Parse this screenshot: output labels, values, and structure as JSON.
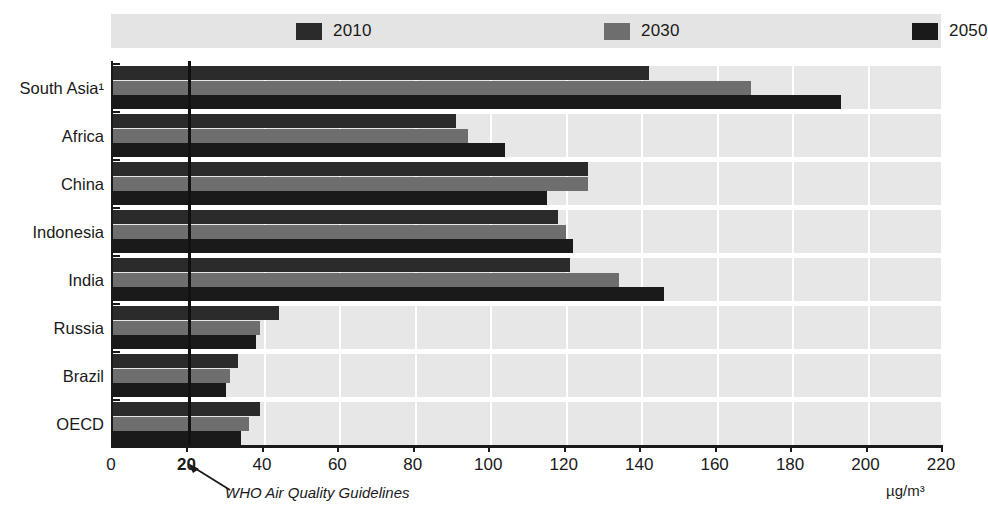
{
  "chart_data": {
    "type": "bar",
    "orientation": "horizontal",
    "title": "",
    "xlabel": "µg/m³",
    "ylabel": "",
    "xlim": [
      0,
      220
    ],
    "xticks": [
      0,
      20,
      40,
      60,
      80,
      100,
      120,
      140,
      160,
      180,
      200,
      220
    ],
    "emphasized_tick": "20",
    "grid": true,
    "legend_position": "top",
    "categories": [
      "South Asia¹",
      "Africa",
      "China",
      "Indonesia",
      "India",
      "Russia",
      "Brazil",
      "OECD"
    ],
    "series": [
      {
        "name": "2010",
        "color": "#2b2b2b",
        "values": [
          142,
          91,
          126,
          118,
          121,
          44,
          33,
          39
        ]
      },
      {
        "name": "2030",
        "color": "#6e6e6e",
        "values": [
          169,
          94,
          126,
          120,
          134,
          39,
          31,
          36
        ]
      },
      {
        "name": "2050",
        "color": "#1a1a1a",
        "values": [
          193,
          104,
          115,
          122,
          146,
          38,
          30,
          34
        ]
      }
    ],
    "annotations": [
      {
        "name": "who-guideline",
        "text": "WHO Air Quality Guidelines",
        "value": 20
      }
    ]
  },
  "legend": {
    "entries": [
      {
        "label": "2010",
        "swatch": "#2b2b2b"
      },
      {
        "label": "2030",
        "swatch": "#6e6e6e"
      },
      {
        "label": "2050",
        "swatch": "#1a1a1a"
      }
    ]
  },
  "axis": {
    "unit_label": "µg/m³",
    "tick_labels": [
      "0",
      "20",
      "40",
      "60",
      "80",
      "100",
      "120",
      "140",
      "160",
      "180",
      "200",
      "220"
    ]
  },
  "annotation": {
    "who_label": "WHO Air Quality Guidelines"
  },
  "colors": {
    "plot_background": "#e7e7e7",
    "legend_background": "#e4e4e4",
    "gridline": "#ffffff",
    "axis": "#1a1a1a",
    "guideline": "#111111"
  }
}
